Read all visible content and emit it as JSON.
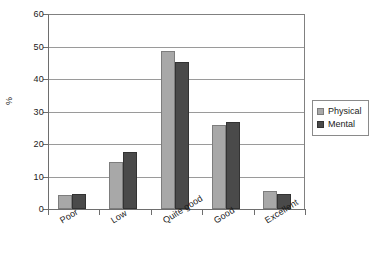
{
  "chart_data": {
    "type": "bar",
    "title": "",
    "subtitle": "",
    "xlabel": "",
    "ylabel": "%",
    "categories": [
      "Poor",
      "Low",
      "Quite good",
      "Good",
      "Excellent"
    ],
    "series": [
      {
        "name": "Physical",
        "color": "#a8a8a8",
        "values": [
          4.4,
          14.5,
          48.7,
          25.7,
          5.5
        ]
      },
      {
        "name": "Mental",
        "color": "#4a4a4a",
        "values": [
          4.5,
          17.4,
          45.1,
          26.8,
          4.5
        ]
      }
    ],
    "ylim": [
      0,
      60
    ],
    "yticks": [
      0,
      10,
      20,
      30,
      40,
      50,
      60
    ],
    "ytick_labels": [
      "0",
      "10",
      "20",
      "30",
      "40",
      "50",
      "60"
    ],
    "grid": "horizontal",
    "legend_position": "right",
    "legend_entries": [
      "Physical",
      "Mental"
    ]
  },
  "legend": {
    "items": [
      {
        "label": "Physical"
      },
      {
        "label": "Mental"
      }
    ]
  }
}
